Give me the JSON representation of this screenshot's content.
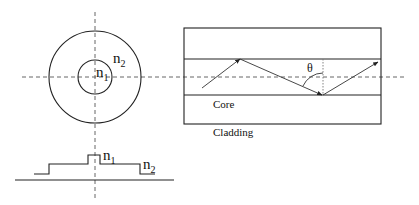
{
  "diagram": {
    "cross_section": {
      "outer_label": "n",
      "outer_sub": "2",
      "inner_label": "n",
      "inner_sub": "1"
    },
    "index_profile": {
      "core_label": "n",
      "core_sub": "1",
      "cladding_label": "n",
      "cladding_sub": "2"
    },
    "longitudinal_view": {
      "angle_label": "θ",
      "core_label": "Core",
      "cladding_label": "Cladding"
    },
    "colors": {
      "line": "#222222",
      "dashed": "#555555",
      "background": "#ffffff"
    }
  }
}
